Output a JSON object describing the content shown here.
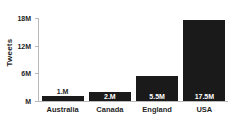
{
  "chart_data": {
    "type": "bar",
    "title": "",
    "subtitle": "",
    "xlabel": "",
    "ylabel": "Tweets",
    "categories": [
      "Australia",
      "Canada",
      "England",
      "USA"
    ],
    "values": [
      1.1,
      2.0,
      5.5,
      17.5
    ],
    "value_labels": [
      "1.M",
      "2.M",
      "5.5M",
      "17.5M"
    ],
    "label_placement": [
      "outside",
      "inside",
      "inside",
      "inside"
    ],
    "units": "millions of tweets",
    "ylim": [
      0,
      18
    ],
    "ytick_values": [
      0,
      6,
      12,
      18
    ],
    "ytick_labels": [
      "M",
      "6M",
      "12M",
      "18M"
    ],
    "grid": false,
    "legend": null,
    "bar_color": "#1a1a1a",
    "axis_color": "#b9b9b9",
    "background_color": "#ffffff",
    "inside_label_color": "#ffffff",
    "outside_label_color": "#1f1f1f"
  }
}
